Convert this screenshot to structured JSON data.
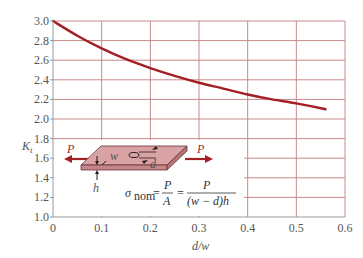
{
  "chart_data": {
    "type": "line",
    "title": "",
    "xlabel": "d/w",
    "ylabel": "K_t",
    "xlim": [
      0,
      0.6
    ],
    "ylim": [
      1.0,
      3.0
    ],
    "x_ticks": [
      "0",
      "0.1",
      "0.2",
      "0.3",
      "0.4",
      "0.5",
      "0.6"
    ],
    "y_ticks": [
      "1.0",
      "1.2",
      "1.4",
      "1.6",
      "1.8",
      "2.0",
      "2.2",
      "2.4",
      "2.6",
      "2.8",
      "3.0"
    ],
    "grid": true,
    "series": [
      {
        "name": "K_t",
        "color": "#a31f24",
        "x": [
          0,
          0.05,
          0.1,
          0.15,
          0.2,
          0.25,
          0.3,
          0.35,
          0.4,
          0.45,
          0.5,
          0.56
        ],
        "y": [
          3.0,
          2.85,
          2.72,
          2.61,
          2.52,
          2.44,
          2.37,
          2.31,
          2.25,
          2.2,
          2.16,
          2.1
        ]
      }
    ],
    "annotations": {
      "load_left": "P",
      "load_right": "P",
      "width_label": "w",
      "hole_label": "d",
      "thickness_label": "h",
      "formula_lhs": "σ",
      "formula_sub": "nom",
      "formula_eq1": "=",
      "formula_num1": "P",
      "formula_den1": "A",
      "formula_eq2": "=",
      "formula_num2": "P",
      "formula_den2": "(w − d)h"
    }
  },
  "colors": {
    "curve": "#a31f24",
    "grid": "#c98a8c",
    "axis": "#999999",
    "plate_top": "#d9a3a5",
    "plate_side": "#c4868a"
  }
}
